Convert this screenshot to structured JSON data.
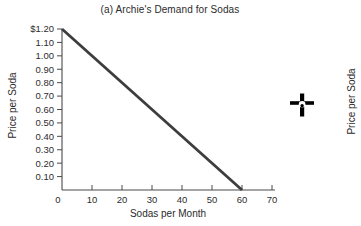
{
  "panel": {
    "title": "(a) Archie's Demand for Sodas",
    "xlabel": "Sodas per Month",
    "ylabel": "Price per Soda"
  },
  "adjacent_panel": {
    "ylabel": "Price per Soda"
  },
  "cursor": {
    "icon": "crosshair-move-pointer"
  },
  "colors": {
    "background": "#ffffff",
    "demand_line": "#3d3d3d",
    "axis": "#4a4a4a",
    "tick_text": "#2d2d2d",
    "cursor": "#0d0d0d"
  },
  "chart_data": {
    "type": "line",
    "title": "(a) Archie's Demand for Sodas",
    "xlabel": "Sodas per Month",
    "ylabel": "Price per Soda",
    "xlim": [
      0,
      70
    ],
    "ylim": [
      0,
      1.2
    ],
    "grid": false,
    "legend": false,
    "x_ticks": [
      0,
      10,
      20,
      30,
      40,
      50,
      60,
      70
    ],
    "y_tick_labels": [
      "$1.20",
      "1.10",
      "1.00",
      "0.90",
      "0.80",
      "0.70",
      "0.60",
      "0.50",
      "0.40",
      "0.30",
      "0.20",
      "0.10"
    ],
    "y_tick_values": [
      1.2,
      1.1,
      1.0,
      0.9,
      0.8,
      0.7,
      0.6,
      0.5,
      0.4,
      0.3,
      0.2,
      0.1
    ],
    "series": [
      {
        "name": "Demand curve",
        "x": [
          0,
          60
        ],
        "y": [
          1.2,
          0.0
        ]
      }
    ]
  }
}
